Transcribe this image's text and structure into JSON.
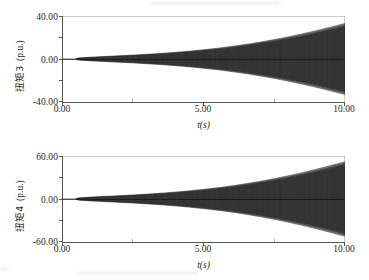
{
  "figure": {
    "background_color": "#ffffff",
    "ink_color": "#111111",
    "axis_color": "#555555"
  },
  "chart_data": [
    {
      "type": "line",
      "id": "panel-top",
      "title": "",
      "xlabel": "t(s)",
      "ylabel": "扭矩3 (p.u.)",
      "ylabel_name": "扭矩3",
      "ylabel_unit": "(p.u.)",
      "xlim": [
        0.0,
        10.0
      ],
      "ylim": [
        -40.0,
        40.0
      ],
      "xticks": [
        0.0,
        5.0,
        10.0
      ],
      "xtick_labels": [
        "0.00",
        "5.00",
        "10.00"
      ],
      "xticks_minor": [
        2.5,
        7.5
      ],
      "yticks": [
        40.0,
        0.0,
        -40.0
      ],
      "ytick_labels": [
        "40.00",
        "0.00",
        "-40.00"
      ],
      "yticks_minor": [
        20.0,
        -20.0
      ],
      "grid": false,
      "legend": null,
      "description": "Exponentially growing torsional oscillation, sub-synchronous resonance torque on shaft section 3",
      "envelope": {
        "onset_time": 0.5,
        "growth": "exponential",
        "amplitude_at_onset": 0.4,
        "amplitude_at_end": 33.0,
        "oscillation_frequency_hz": 24
      },
      "series": [
        {
          "name": "扭矩3",
          "envelope_points": [
            {
              "t": 0.0,
              "amp": 0.0
            },
            {
              "t": 0.45,
              "amp": 0.2
            },
            {
              "t": 0.6,
              "amp": 1.0
            },
            {
              "t": 1.0,
              "amp": 1.7
            },
            {
              "t": 1.5,
              "amp": 2.3
            },
            {
              "t": 2.0,
              "amp": 3.0
            },
            {
              "t": 2.5,
              "amp": 3.6
            },
            {
              "t": 3.0,
              "amp": 4.4
            },
            {
              "t": 3.5,
              "amp": 5.2
            },
            {
              "t": 4.0,
              "amp": 6.2
            },
            {
              "t": 4.5,
              "amp": 7.3
            },
            {
              "t": 5.0,
              "amp": 8.6
            },
            {
              "t": 5.5,
              "amp": 10.0
            },
            {
              "t": 6.0,
              "amp": 11.7
            },
            {
              "t": 6.5,
              "amp": 13.6
            },
            {
              "t": 7.0,
              "amp": 15.7
            },
            {
              "t": 7.5,
              "amp": 18.0
            },
            {
              "t": 8.0,
              "amp": 20.6
            },
            {
              "t": 8.5,
              "amp": 23.4
            },
            {
              "t": 9.0,
              "amp": 26.4
            },
            {
              "t": 9.5,
              "amp": 29.7
            },
            {
              "t": 10.0,
              "amp": 33.0
            }
          ]
        }
      ]
    },
    {
      "type": "line",
      "id": "panel-bottom",
      "title": "",
      "xlabel": "t(s)",
      "ylabel": "扭矩4 (p.u.)",
      "ylabel_name": "扭矩4",
      "ylabel_unit": "(p.u.)",
      "xlim": [
        0.0,
        10.0
      ],
      "ylim": [
        -60.0,
        60.0
      ],
      "xticks": [
        0.0,
        5.0,
        10.0
      ],
      "xtick_labels": [
        "0.00",
        "5.00",
        "10.00"
      ],
      "xticks_minor": [
        2.5,
        7.5
      ],
      "yticks": [
        60.0,
        0.0,
        -60.0
      ],
      "ytick_labels": [
        "60.00",
        "0.00",
        "-60.00"
      ],
      "yticks_minor": [
        30.0,
        -30.0
      ],
      "grid": false,
      "legend": null,
      "description": "Exponentially growing torsional oscillation, sub-synchronous resonance torque on shaft section 4",
      "envelope": {
        "onset_time": 0.5,
        "growth": "exponential",
        "amplitude_at_onset": 0.6,
        "amplitude_at_end": 52.0,
        "oscillation_frequency_hz": 24
      },
      "series": [
        {
          "name": "扭矩4",
          "envelope_points": [
            {
              "t": 0.0,
              "amp": 0.0
            },
            {
              "t": 0.45,
              "amp": 0.3
            },
            {
              "t": 0.6,
              "amp": 1.6
            },
            {
              "t": 1.0,
              "amp": 2.7
            },
            {
              "t": 1.5,
              "amp": 3.6
            },
            {
              "t": 2.0,
              "amp": 4.6
            },
            {
              "t": 2.5,
              "amp": 5.6
            },
            {
              "t": 3.0,
              "amp": 6.8
            },
            {
              "t": 3.5,
              "amp": 8.1
            },
            {
              "t": 4.0,
              "amp": 9.6
            },
            {
              "t": 4.5,
              "amp": 11.4
            },
            {
              "t": 5.0,
              "amp": 13.4
            },
            {
              "t": 5.5,
              "amp": 15.7
            },
            {
              "t": 6.0,
              "amp": 18.3
            },
            {
              "t": 6.5,
              "amp": 21.3
            },
            {
              "t": 7.0,
              "amp": 24.6
            },
            {
              "t": 7.5,
              "amp": 28.3
            },
            {
              "t": 8.0,
              "amp": 32.4
            },
            {
              "t": 8.5,
              "amp": 36.8
            },
            {
              "t": 9.0,
              "amp": 41.6
            },
            {
              "t": 9.5,
              "amp": 46.7
            },
            {
              "t": 10.0,
              "amp": 52.0
            }
          ]
        }
      ]
    }
  ]
}
